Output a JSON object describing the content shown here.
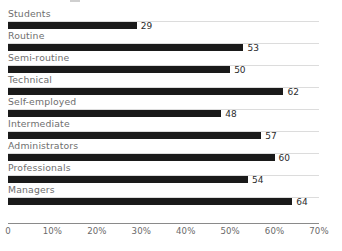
{
  "chart_data": {
    "type": "bar",
    "orientation": "horizontal",
    "title": "",
    "xlabel": "",
    "ylabel": "",
    "xlim": [
      0,
      70
    ],
    "grid": true,
    "legend": false,
    "tick_labels": [
      "0",
      "10%",
      "20%",
      "30%",
      "40%",
      "50%",
      "60%",
      "70%"
    ],
    "tick_values": [
      0,
      10,
      20,
      30,
      40,
      50,
      60,
      70
    ],
    "categories": [
      "Students",
      "Routine",
      "Semi-routine",
      "Technical",
      "Self-employed",
      "Intermediate",
      "Administrators",
      "Professionals",
      "Managers"
    ],
    "values": [
      29,
      53,
      50,
      62,
      48,
      57,
      60,
      54,
      64
    ],
    "value_labels": [
      "29",
      "53",
      "50",
      "62",
      "48",
      "57",
      "60",
      "54",
      "64"
    ],
    "colors": {
      "bar": "#1a1a1a",
      "category_label": "#6e6e6e",
      "value_label": "#2b2b2b",
      "gridline": "#dcdcdc",
      "axis": "#8a8a8a",
      "background": "#ffffff"
    }
  }
}
